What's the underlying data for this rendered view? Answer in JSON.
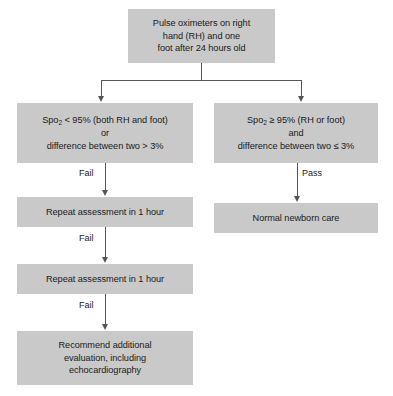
{
  "diagram": {
    "fill_color": "#c9c9c9",
    "line_color": "#555555",
    "text_color": "#1a1a1a",
    "background_color": "#ffffff"
  },
  "nodes": {
    "start": {
      "id": "start",
      "text": "Pulse oximeters on right\nhand (RH) and one\nfoot after 24 hours old"
    },
    "fail_criteria": {
      "id": "fail-criteria",
      "line1_prefix": "Spo",
      "line1_sub": "2",
      "line1_suffix": " < 95% (both RH and foot)",
      "line2": "or",
      "line3": "difference between two > 3%"
    },
    "pass_criteria": {
      "id": "pass-criteria",
      "line1_prefix": "Spo",
      "line1_sub": "2",
      "line1_suffix": " ≥ 95% (RH or foot)",
      "line2": "and",
      "line3": "difference between two ≤ 3%"
    },
    "repeat_1": {
      "id": "repeat-assessment-1",
      "text": "Repeat assessment in 1 hour"
    },
    "normal_care": {
      "id": "normal-newborn-care",
      "text": "Normal newborn care"
    },
    "repeat_2": {
      "id": "repeat-assessment-2",
      "text": "Repeat assessment in 1 hour"
    },
    "recommend": {
      "id": "recommend-evaluation",
      "text": "Recommend additional\nevaluation, including\nechocardiography"
    }
  },
  "edges": {
    "fail_1": "Fail",
    "fail_2": "Fail",
    "fail_3": "Fail",
    "pass": "Pass"
  }
}
